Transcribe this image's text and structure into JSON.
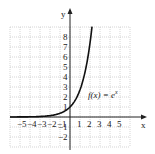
{
  "chart_data": {
    "type": "line",
    "title": "",
    "annotation": "f(x) = e^x",
    "annotation_text": "f(x) = e",
    "annotation_sup": "x",
    "xlabel": "x",
    "ylabel": "y",
    "xlim": [
      -6,
      6
    ],
    "ylim": [
      -3,
      9
    ],
    "grid": true,
    "x_ticks": [
      "-5",
      "-4",
      "-3",
      "-2",
      "-1",
      "1",
      "2",
      "3",
      "4",
      "5"
    ],
    "y_ticks": [
      "8",
      "7",
      "6",
      "5",
      "4",
      "3",
      "2",
      "1",
      "-1",
      "-2"
    ],
    "series": [
      {
        "name": "f(x) = e^x",
        "x": [
          -3,
          -2,
          -1,
          0,
          1,
          1.5,
          2,
          2.2
        ],
        "y": [
          0.05,
          0.14,
          0.37,
          1,
          2.72,
          4.48,
          7.39,
          9.03
        ]
      }
    ]
  },
  "colors": {
    "curve": "#111111",
    "grid": "#bbbbbb",
    "axis": "#222222"
  }
}
